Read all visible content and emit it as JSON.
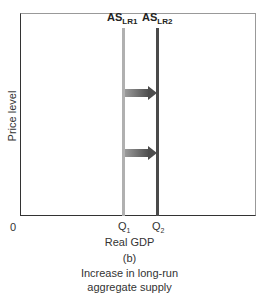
{
  "chart_data": {
    "type": "line",
    "panel_label": "(b)",
    "xlabel": "Real GDP",
    "ylabel": "Price level",
    "origin_label": "0",
    "x_ticks": [
      {
        "label": "Q",
        "sub": "1",
        "x": 1
      },
      {
        "label": "Q",
        "sub": "2",
        "x": 2
      }
    ],
    "series": [
      {
        "name": "AS_LR1",
        "label_main": "AS",
        "label_sub": "LR1",
        "orientation": "vertical",
        "x": 1,
        "color": "#b0b0b0"
      },
      {
        "name": "AS_LR2",
        "label_main": "AS",
        "label_sub": "LR2",
        "orientation": "vertical",
        "x": 2,
        "color": "#4a4a4a"
      }
    ],
    "annotations": [
      {
        "type": "arrow",
        "direction": "right",
        "from": "AS_LR1",
        "to": "AS_LR2",
        "position": "upper"
      },
      {
        "type": "arrow",
        "direction": "right",
        "from": "AS_LR1",
        "to": "AS_LR2",
        "position": "lower"
      }
    ],
    "grid": false,
    "legend": "none"
  },
  "labels": {
    "as1_main": "AS",
    "as1_sub": "LR1",
    "as2_main": "AS",
    "as2_sub": "LR2",
    "ylabel": "Price level",
    "origin": "0",
    "q1_main": "Q",
    "q1_sub": "1",
    "q2_main": "Q",
    "q2_sub": "2",
    "xlabel": "Real GDP",
    "panel": "(b)",
    "caption_line1": "Increase in long-run",
    "caption_line2": "aggregate supply"
  }
}
